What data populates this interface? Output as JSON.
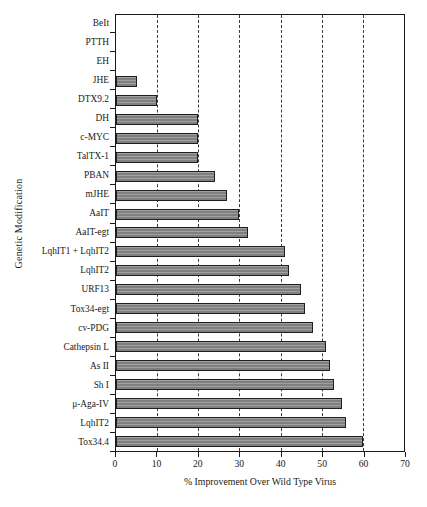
{
  "chart_data": {
    "type": "bar",
    "orientation": "horizontal",
    "title": "",
    "xlabel": "% Improvement Over Wild Type Virus",
    "ylabel": "Genetic Modification",
    "xlim": [
      0,
      70
    ],
    "xticks": [
      0,
      10,
      20,
      30,
      40,
      50,
      60,
      70
    ],
    "grid": "vertical-dashed",
    "legend": "none",
    "bar_color": "#878787",
    "bar_edge_color": "#1f1f1f",
    "categories": [
      "BeIt",
      "PTTH",
      "EH",
      "JHE",
      "DTX9.2",
      "DH",
      "c-MYC",
      "TalTX-1",
      "PBAN",
      "mJHE",
      "AaIT",
      "AaIT-egt",
      "LqhIT1 + LqhIT2",
      "LqhIT2",
      "URF13",
      "Tox34-egt",
      "cv-PDG",
      "Cathepsin L",
      "As II",
      "Sh I",
      "μ-Aga-IV",
      "LqhIT2",
      "Tox34.4"
    ],
    "values": [
      0,
      0,
      0,
      5,
      10,
      20,
      20,
      20,
      24,
      27,
      30,
      32,
      41,
      42,
      45,
      46,
      48,
      51,
      52,
      53,
      55,
      56,
      60
    ]
  }
}
